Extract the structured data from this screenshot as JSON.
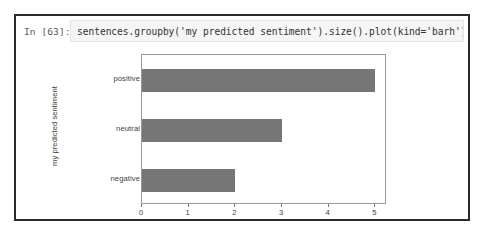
{
  "cell": {
    "prompt": "In [63]:",
    "code": "sentences.groupby('my predicted sentiment').size().plot(kind='barh');"
  },
  "chart_data": {
    "type": "bar",
    "orientation": "horizontal",
    "title": "",
    "xlabel": "",
    "ylabel": "my predicted sentiment",
    "categories": [
      "negative",
      "neutral",
      "positive"
    ],
    "values": [
      2,
      3,
      5
    ],
    "xticks": [
      "0",
      "1",
      "2",
      "3",
      "4",
      "5"
    ],
    "xlim": [
      0,
      5.25
    ],
    "grid": false,
    "legend": false,
    "bar_color": "#767676",
    "axes_color": "#9a9a9a"
  }
}
